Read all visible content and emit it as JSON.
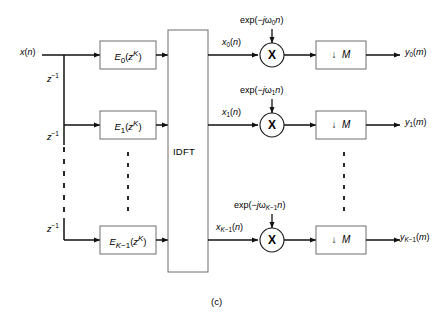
{
  "figure": {
    "caption": "(c)",
    "idft_label": "IDFT",
    "input_label_html": "<i>x</i>(<i>n</i>)"
  },
  "delays": [
    {
      "label_html": "<i>z</i><sup>−1</sup>"
    },
    {
      "label_html": "<i>z</i><sup>−1</sup>"
    },
    {
      "label_html": "<i>z</i><sup>−1</sup>"
    }
  ],
  "filters": [
    {
      "label_html": "<i>E</i><sub>0</sub>(<i>z</i><sup><i>K</i></sup>)"
    },
    {
      "label_html": "<i>E</i><sub>1</sub>(<i>z</i><sup><i>K</i></sup>)"
    },
    {
      "label_html": "<i>E</i><sub><i>K</i>−1</sub>(<i>z</i><sup><i>K</i></sup>)"
    }
  ],
  "branches": [
    {
      "signal_html": "<i>x</i><sub>0</sub>(<i>n</i>)",
      "exp_html": "exp(−<i>j</i>ω<sub>0</sub><i>n</i>)",
      "multiplier_symbol": "X",
      "downsampler_html": "↓&nbsp;&nbsp;<i>M</i>",
      "output_html": "<i>y</i><sub>0</sub>(<i>m</i>)"
    },
    {
      "signal_html": "<i>x</i><sub>1</sub>(<i>n</i>)",
      "exp_html": "exp(−<i>j</i>ω<sub>1</sub><i>n</i>)",
      "multiplier_symbol": "X",
      "downsampler_html": "↓&nbsp;&nbsp;<i>M</i>",
      "output_html": "<i>y</i><sub>1</sub>(<i>m</i>)"
    },
    {
      "signal_html": "<i>x</i><sub><i>K</i>−1</sub>(<i>n</i>)",
      "exp_html": "exp(−<i>j</i>ω<sub><i>K</i>−1</sub><i>n</i>)",
      "multiplier_symbol": "X",
      "downsampler_html": "↓&nbsp;&nbsp;<i>M</i>",
      "output_html": "<i>y</i><sub><i>K</i>−1</sub>(<i>m</i>)"
    }
  ],
  "colors": {
    "line": "#111111",
    "box_stroke": "#6f6f6f",
    "background": "#ffffff"
  }
}
